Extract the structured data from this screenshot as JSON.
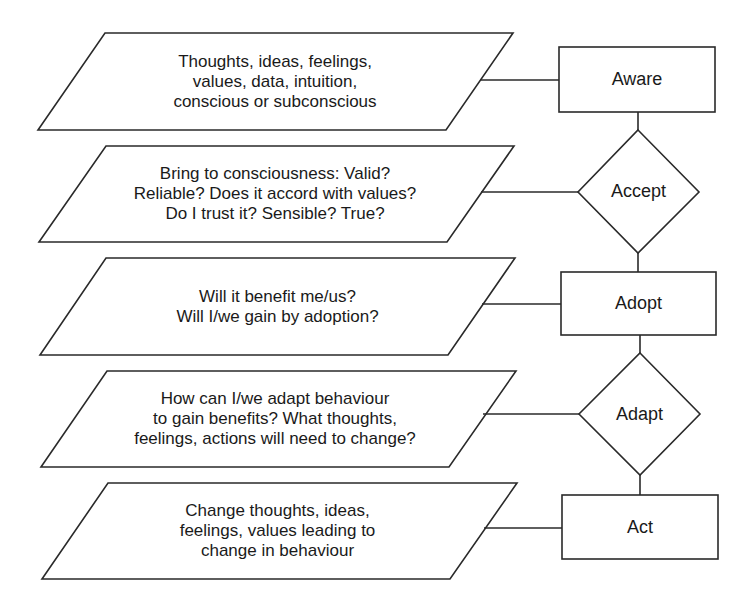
{
  "diagram": {
    "type": "flowchart",
    "stroke_color": "#2a2a2a",
    "background": "#ffffff",
    "inputs": [
      {
        "id": "p1",
        "text": "Thoughts, ideas, feelings,\nvalues, data, intuition,\nconscious or subconscious"
      },
      {
        "id": "p2",
        "text": "Bring to consciousness: Valid?\nReliable? Does it accord with values?\nDo I trust it? Sensible? True?"
      },
      {
        "id": "p3",
        "text": "Will it benefit me/us?\nWill I/we gain by adoption?"
      },
      {
        "id": "p4",
        "text": "How can I/we adapt behaviour\nto gain benefits? What thoughts,\nfeelings, actions will need to change?"
      },
      {
        "id": "p5",
        "text": "Change thoughts, ideas,\nfeelings, values leading to\nchange in behaviour"
      }
    ],
    "stages": [
      {
        "id": "s1",
        "shape": "rectangle",
        "label": "Aware"
      },
      {
        "id": "s2",
        "shape": "diamond",
        "label": "Accept"
      },
      {
        "id": "s3",
        "shape": "rectangle",
        "label": "Adopt"
      },
      {
        "id": "s4",
        "shape": "diamond",
        "label": "Adapt"
      },
      {
        "id": "s5",
        "shape": "rectangle",
        "label": "Act"
      }
    ],
    "connections": [
      [
        "p1",
        "s1"
      ],
      [
        "p2",
        "s2"
      ],
      [
        "p3",
        "s3"
      ],
      [
        "p4",
        "s4"
      ],
      [
        "p5",
        "s5"
      ],
      [
        "s1",
        "s2"
      ],
      [
        "s2",
        "s3"
      ],
      [
        "s3",
        "s4"
      ],
      [
        "s4",
        "s5"
      ]
    ]
  }
}
